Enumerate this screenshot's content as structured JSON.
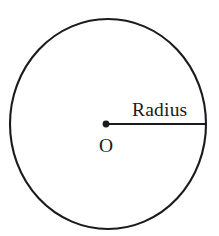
{
  "figure": {
    "kind": "geometry-diagram",
    "canvas": {
      "width": 219,
      "height": 236,
      "background_color": "#ffffff"
    },
    "ink_color": "#1a1a20",
    "labels": {
      "radius": "Radius",
      "center": "O"
    },
    "circle": {
      "center_x": 108,
      "center_y": 124,
      "radius_x": 98,
      "radius_y": 105,
      "stroke_width": 2.1,
      "fill": "none"
    },
    "center_point": {
      "x": 106,
      "y": 124,
      "dot_radius": 3.4
    },
    "radius_segment": {
      "x1": 106,
      "y1": 124,
      "x2": 206,
      "y2": 124,
      "stroke_width": 2.0
    },
    "radius_label_position": {
      "x": 132,
      "y": 116
    },
    "center_label_position": {
      "x": 99,
      "y": 152
    }
  }
}
